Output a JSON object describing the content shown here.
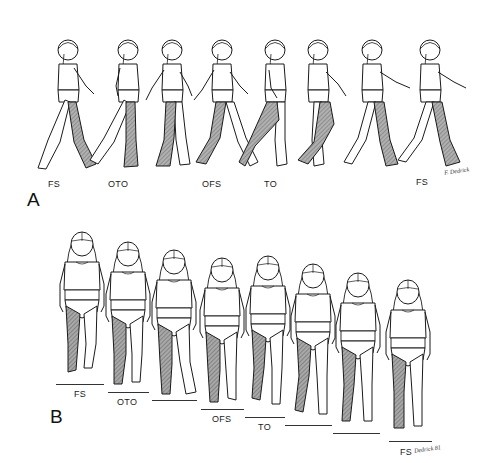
{
  "figure": {
    "panel_a": {
      "letter": "A",
      "view": "sagittal (side) view of child walking",
      "labels": [
        {
          "text": "FS",
          "x": 57,
          "y": 179
        },
        {
          "text": "OTO",
          "x": 109,
          "y": 179
        },
        {
          "text": "OFS",
          "x": 202,
          "y": 179
        },
        {
          "text": "TO",
          "x": 264,
          "y": 179
        },
        {
          "text": "FS",
          "x": 418,
          "y": 177
        }
      ],
      "figure_count": 8,
      "signature": "F. Dedrick"
    },
    "panel_b": {
      "letter": "B",
      "view": "frontal (anterior) view of child walking",
      "labels": [
        {
          "text": "FS",
          "x": 73,
          "y": 393
        },
        {
          "text": "OTO",
          "x": 117,
          "y": 401
        },
        {
          "text": "OFS",
          "x": 212,
          "y": 416
        },
        {
          "text": "TO",
          "x": 258,
          "y": 424
        },
        {
          "text": "FS",
          "x": 400,
          "y": 449
        }
      ],
      "figure_count": 8,
      "signature": "Dedrick 81"
    },
    "legend": {
      "shaded_limb": "reference (stance) leg shown with hatched gray shading",
      "FS": "foot strike",
      "OTO": "opposite toe off",
      "OFS": "opposite foot strike",
      "TO": "toe off"
    },
    "colors": {
      "line": "#1a1a1a",
      "shade": "#9a9a9a",
      "background": "#ffffff"
    }
  }
}
